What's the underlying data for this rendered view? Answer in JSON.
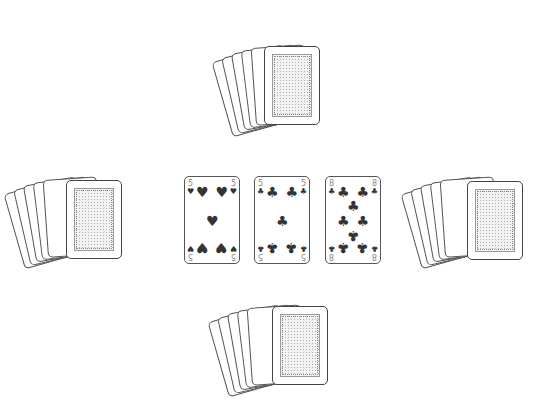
{
  "table": {
    "background": "#ffffff",
    "players": [
      {
        "position": "top",
        "card_back_count": 7
      },
      {
        "position": "left",
        "card_back_count": 7
      },
      {
        "position": "right",
        "card_back_count": 7
      },
      {
        "position": "bottom",
        "card_back_count": 7
      }
    ],
    "played_cards": [
      {
        "rank": "5",
        "suit": "hearts",
        "suit_glyph": "♥"
      },
      {
        "rank": "5",
        "suit": "clubs",
        "suit_glyph": "♣"
      },
      {
        "rank": "8",
        "suit": "clubs",
        "suit_glyph": "♣"
      }
    ]
  }
}
